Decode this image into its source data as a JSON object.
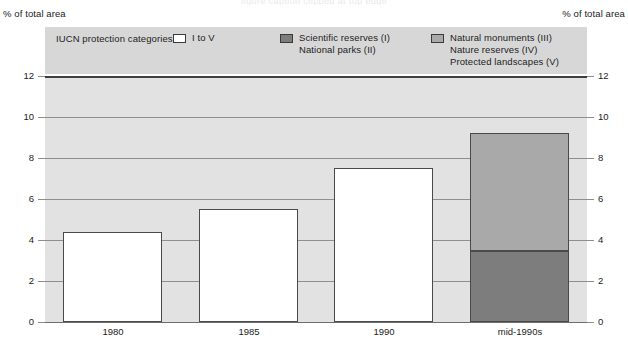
{
  "figure": {
    "top_clipped_caption": "figure caption clipped at top edge",
    "axis_unit_left": "% of total area",
    "axis_unit_right": "% of total area"
  },
  "legend": {
    "title": "IUCN protection categories:",
    "columns": [
      {
        "swatch": "white-swatch",
        "swatch_color": "#ffffff",
        "lines": [
          "I to V"
        ]
      },
      {
        "swatch": "dark-gray-swatch",
        "swatch_color": "#7d7d7d",
        "lines": [
          "Scientific reserves (I)",
          "National parks (II)"
        ]
      },
      {
        "swatch": "light-gray-swatch",
        "swatch_color": "#a9a9a9",
        "lines": [
          "Natural monuments (III)",
          "Nature reserves (IV)",
          "Protected landscapes (V)"
        ]
      }
    ]
  },
  "chart_data": {
    "type": "bar",
    "title": "",
    "xlabel": "",
    "ylabel": "% of total area",
    "ylim": [
      0,
      12
    ],
    "yticks": [
      0,
      2,
      4,
      6,
      8,
      10,
      12
    ],
    "ytick_labels": [
      "0",
      "2",
      "4",
      "6",
      "8",
      "10",
      "12"
    ],
    "grid": true,
    "legend_position": "top",
    "dual_y_axis": true,
    "categories": [
      "1980",
      "1985",
      "1990",
      "mid-1990s"
    ],
    "series": [
      {
        "name": "I to V",
        "swatch_color": "#ffffff",
        "values": [
          4.4,
          5.5,
          7.5,
          null
        ]
      },
      {
        "name": "Scientific reserves (I) / National parks (II)",
        "swatch_color": "#7d7d7d",
        "values": [
          null,
          null,
          null,
          3.45
        ]
      },
      {
        "name": "Natural monuments (III) / Nature reserves (IV) / Protected landscapes (V)",
        "swatch_color": "#a9a9a9",
        "values": [
          null,
          null,
          null,
          5.75
        ]
      }
    ],
    "totals": [
      4.4,
      5.5,
      7.5,
      9.2
    ]
  },
  "colors": {
    "plot_background": "#e2e2e2",
    "legend_background": "#d7d7d7",
    "gridline": "#8e8e8e",
    "frame_top": "#3f3f3f"
  }
}
